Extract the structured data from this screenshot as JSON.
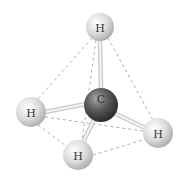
{
  "diagram": {
    "type": "molecule-3d",
    "molecule": "methane tetrahedral geometry",
    "colors": {
      "hydrogen": "#d8d8d8",
      "carbon": "#555555",
      "bond": "#e8e8e8",
      "dashed_edge": "#9a9a9a",
      "background": "#ffffff"
    },
    "atoms": [
      {
        "id": "h_top",
        "label": "H",
        "x": 100,
        "y": 27,
        "r": 14
      },
      {
        "id": "h_left",
        "label": "H",
        "x": 31,
        "y": 112,
        "r": 15
      },
      {
        "id": "h_right",
        "label": "H",
        "x": 158,
        "y": 133,
        "r": 15
      },
      {
        "id": "h_bottom",
        "label": "H",
        "x": 78,
        "y": 155,
        "r": 15
      },
      {
        "id": "c_center",
        "label": "C",
        "x": 101,
        "y": 105,
        "r": 17
      }
    ],
    "labels": {
      "h_top": "H",
      "h_left": "H",
      "h_right": "H",
      "h_bottom": "H",
      "c_center": "C"
    }
  }
}
